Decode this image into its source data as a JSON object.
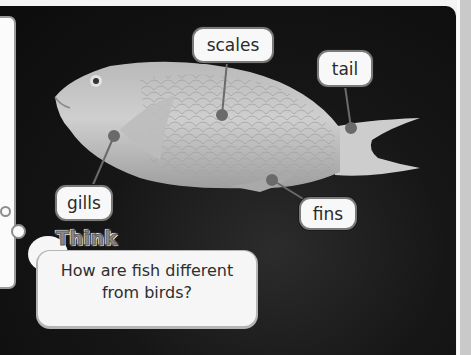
{
  "diagram": {
    "subject": "fish",
    "labels": [
      {
        "id": "scales",
        "text": "scales"
      },
      {
        "id": "tail",
        "text": "tail"
      },
      {
        "id": "gills",
        "text": "gills"
      },
      {
        "id": "fins",
        "text": "fins"
      }
    ]
  },
  "think": {
    "title": "Think",
    "question_line1": "How are fish different",
    "question_line2": "from birds?"
  },
  "colors": {
    "background": "#111111",
    "fish_body": "#c8c8c8",
    "label_fill": "#f8f8f8",
    "label_border": "#7a7a7a",
    "leader_line": "#6a6a6a"
  }
}
